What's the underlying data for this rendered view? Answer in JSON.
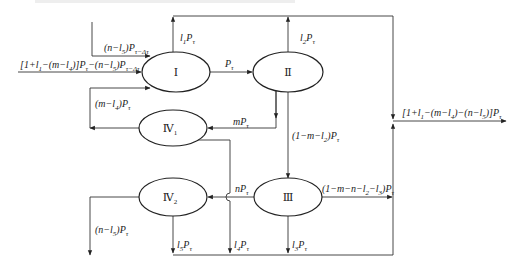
{
  "diagram": {
    "nodes": [
      {
        "id": "I",
        "label": "Ⅰ",
        "sub": ""
      },
      {
        "id": "II",
        "label": "Ⅱ",
        "sub": ""
      },
      {
        "id": "III",
        "label": "Ⅲ",
        "sub": ""
      },
      {
        "id": "IV1",
        "label": "Ⅳ",
        "sub": "1"
      },
      {
        "id": "IV2",
        "label": "Ⅳ",
        "sub": "2"
      }
    ],
    "edges": {
      "input_main": {
        "parts": [
          "[1+",
          "l",
          "1",
          "−(m−",
          "l",
          "4",
          ")]P",
          "τ",
          "−(n−",
          "l",
          "5",
          ")P",
          "τ−Δτ"
        ]
      },
      "input_top": {
        "parts": [
          "(n−",
          "l",
          "5",
          ")P",
          "τ−Δτ"
        ]
      },
      "I_loss": {
        "parts": [
          "l",
          "1",
          "P",
          "τ"
        ]
      },
      "I_to_II": {
        "parts": [
          "P",
          "τ"
        ]
      },
      "II_loss": {
        "parts": [
          "l",
          "2",
          "P",
          "τ"
        ]
      },
      "II_to_IV1": {
        "parts": [
          "mP",
          "τ"
        ]
      },
      "II_to_III": {
        "parts": [
          "(1−m−",
          "l",
          "2",
          ")P",
          "τ"
        ]
      },
      "IV1_to_I": {
        "parts": [
          "(m−",
          "l",
          "4",
          ")P",
          "τ"
        ]
      },
      "III_to_IV2": {
        "parts": [
          "nP",
          "τ"
        ]
      },
      "III_out": {
        "parts": [
          "(1−m−n−",
          "l",
          "2",
          "−",
          "l",
          "3",
          ")P",
          "τ"
        ]
      },
      "IV2_out": {
        "parts": [
          "(n−",
          "l",
          "5",
          ")P",
          "τ"
        ]
      },
      "IV2_loss": {
        "parts": [
          "l",
          "5",
          "P",
          "τ"
        ]
      },
      "IV1_loss": {
        "parts": [
          "l",
          "4",
          "P",
          "τ"
        ]
      },
      "III_loss": {
        "parts": [
          "l",
          "3",
          "P",
          "τ"
        ]
      },
      "final_out": {
        "parts": [
          "[1+",
          "l",
          "1",
          "−(m−",
          "l",
          "4",
          ")−(n−",
          "l",
          "5",
          ")]P",
          "τ"
        ]
      }
    }
  }
}
